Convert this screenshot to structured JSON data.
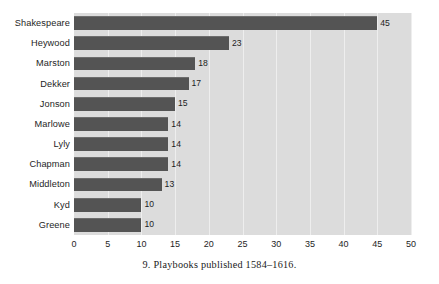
{
  "figure": {
    "caption": "9.  Playbooks published 1584–1616."
  },
  "colors": {
    "bar": "#545454",
    "plot_background": "#dcdcdc",
    "gridline": "#eeeeee",
    "page_background": "#ffffff",
    "text": "#1e1e1e"
  },
  "chart_data": {
    "type": "bar",
    "orientation": "horizontal",
    "title": "",
    "subtitle": "",
    "xlabel": "",
    "ylabel": "",
    "categories": [
      "Shakespeare",
      "Heywood",
      "Marston",
      "Dekker",
      "Jonson",
      "Marlowe",
      "Lyly",
      "Chapman",
      "Middleton",
      "Kyd",
      "Greene"
    ],
    "values": [
      45,
      23,
      18,
      17,
      15,
      14,
      14,
      14,
      13,
      10,
      10
    ],
    "data_labels": [
      "45",
      "23",
      "18",
      "17",
      "15",
      "14",
      "14",
      "14",
      "13",
      "10",
      "10"
    ],
    "xlim": [
      0,
      50
    ],
    "ylim": null,
    "xticks": [
      0,
      5,
      10,
      15,
      20,
      25,
      30,
      35,
      40,
      45,
      50
    ],
    "xtick_labels": [
      "0",
      "5",
      "10",
      "15",
      "20",
      "25",
      "30",
      "35",
      "40",
      "45",
      "50"
    ],
    "grid": true,
    "grid_axis": "x",
    "legend": false,
    "legend_position": "none"
  }
}
